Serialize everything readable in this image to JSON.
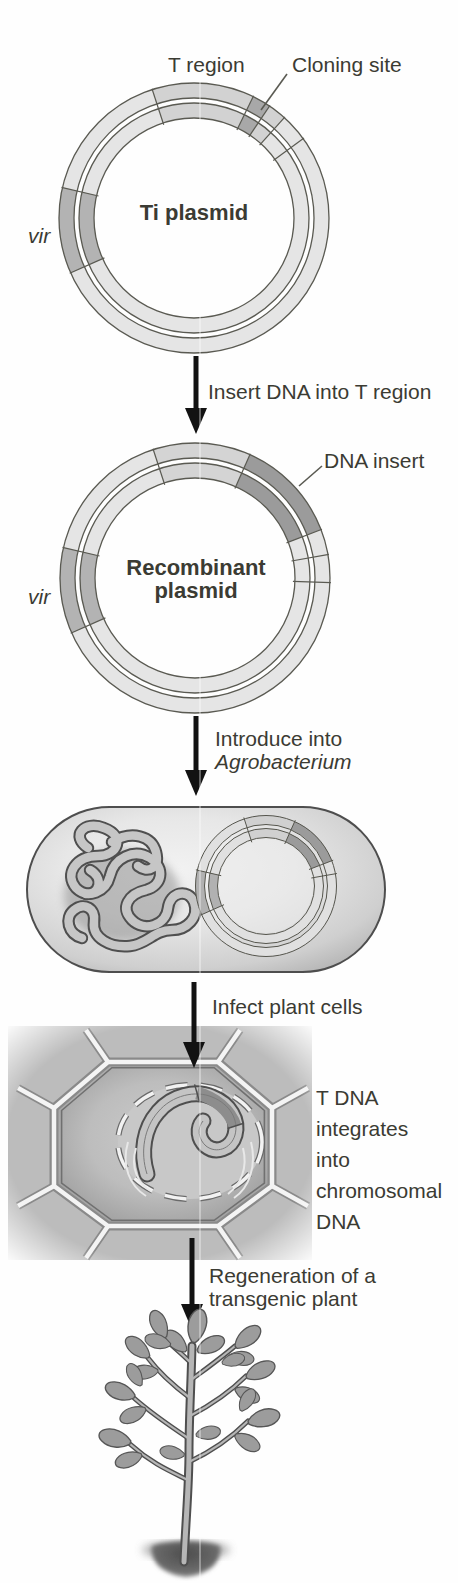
{
  "palette": {
    "text": "#3b3b33",
    "arrow": "#121212",
    "ring_base": "#e5e5e5",
    "t_region_segment": "#d2d2d2",
    "cloning_site_segment": "#a8a8a8",
    "vir_segment": "#b3b3b3",
    "dna_insert_segment": "#9b9b9b",
    "outline": "#5a5a52",
    "cell_wall": "#f4f4f4",
    "leaf": "#9c9c9c"
  },
  "figures": {
    "ti_plasmid": {
      "title": "Ti plasmid",
      "t_region_label": "T region",
      "cloning_site_label": "Cloning site",
      "vir_label": "vir"
    },
    "step1_arrow": {
      "label": "Insert DNA into T region"
    },
    "recombinant_plasmid": {
      "title_line1": "Recombinant",
      "title_line2": "plasmid",
      "dna_insert_label": "DNA insert",
      "vir_label": "vir"
    },
    "step2_arrow": {
      "label_line1": "Introduce into",
      "label_line2": "Agrobacterium"
    },
    "step3_arrow": {
      "label": "Infect plant cells"
    },
    "plant_cell": {
      "annotation_lines": [
        "T DNA",
        "integrates",
        "into",
        "chromosomal",
        "DNA"
      ]
    },
    "step4_arrow": {
      "label_line1": "Regeneration of a",
      "label_line2": "transgenic plant"
    }
  }
}
